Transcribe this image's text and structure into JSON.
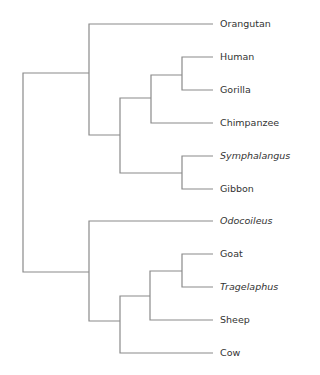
{
  "diagram": {
    "type": "phylogenetic-tree",
    "line_color": "#8a8a8a",
    "text_color": "#333333",
    "leaves": [
      {
        "label": "Orangutan",
        "italic": false,
        "y": 24
      },
      {
        "label": "Human",
        "italic": false,
        "y": 57
      },
      {
        "label": "Gorilla",
        "italic": false,
        "y": 90
      },
      {
        "label": "Chimpanzee",
        "italic": false,
        "y": 123
      },
      {
        "label": "Symphalangus",
        "italic": true,
        "y": 156
      },
      {
        "label": "Gibbon",
        "italic": false,
        "y": 189
      },
      {
        "label": "Odocoileus",
        "italic": true,
        "y": 221
      },
      {
        "label": "Goat",
        "italic": false,
        "y": 254
      },
      {
        "label": "Tragelaphus",
        "italic": true,
        "y": 287
      },
      {
        "label": "Sheep",
        "italic": false,
        "y": 320
      },
      {
        "label": "Cow",
        "italic": false,
        "y": 353
      }
    ],
    "topology": "((Orangutan,(((Human,Gorilla),Chimpanzee),(Symphalangus,Gibbon))),(Odocoileus,(((Goat,Tragelaphus),Sheep),Cow)))"
  }
}
